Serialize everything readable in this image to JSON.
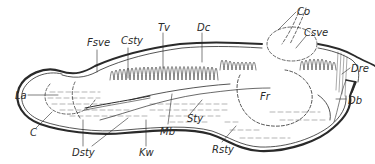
{
  "figure": {
    "type": "anatomical line drawing",
    "ink_color": "#2a2a2a",
    "background": "#ffffff",
    "labels": [
      {
        "id": "fsve",
        "text": "Fsve",
        "x": 87,
        "y": 38
      },
      {
        "id": "csty",
        "text": "Csty",
        "x": 121,
        "y": 36
      },
      {
        "id": "tv",
        "text": "Tv",
        "x": 158,
        "y": 23
      },
      {
        "id": "dc",
        "text": "Dc",
        "x": 197,
        "y": 23
      },
      {
        "id": "co",
        "text": "Co",
        "x": 297,
        "y": 7
      },
      {
        "id": "csve",
        "text": "Csve",
        "x": 304,
        "y": 28
      },
      {
        "id": "dre",
        "text": "Dre",
        "x": 351,
        "y": 64
      },
      {
        "id": "la",
        "text": "La",
        "x": 15,
        "y": 91
      },
      {
        "id": "fr",
        "text": "Fr",
        "x": 260,
        "y": 92
      },
      {
        "id": "db",
        "text": "Db",
        "x": 348,
        "y": 96
      },
      {
        "id": "c",
        "text": "C",
        "x": 30,
        "y": 128
      },
      {
        "id": "mb",
        "text": "Mb",
        "x": 160,
        "y": 127
      },
      {
        "id": "sty",
        "text": "Sty",
        "x": 187,
        "y": 114
      },
      {
        "id": "dsty",
        "text": "Dsty",
        "x": 72,
        "y": 148
      },
      {
        "id": "kw",
        "text": "Kw",
        "x": 139,
        "y": 148
      },
      {
        "id": "rsty",
        "text": "Rsty",
        "x": 212,
        "y": 145
      }
    ]
  }
}
